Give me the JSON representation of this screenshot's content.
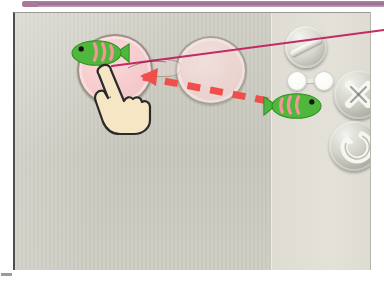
{
  "app": {
    "title": "Fish Transfer Simulation",
    "scene_type": "interactive-lab-panel"
  },
  "top_bar": {
    "name": "decorative-header-bar",
    "color": "#9a6d90"
  },
  "panel": {
    "background_color": "#c9c9bf",
    "right_strip_color": "#e0ded5",
    "border_color": "#4f4f4a"
  },
  "dishes": [
    {
      "id": "dish-left",
      "label": "Left petri dish",
      "fill_color": "#f6cccd",
      "contains_fish": true,
      "state": "active"
    },
    {
      "id": "dish-right",
      "label": "Right petri dish",
      "fill_color": "#f2d6d3",
      "contains_fish": false,
      "state": "faded",
      "ghost_text": ""
    }
  ],
  "fish": [
    {
      "id": "fish-in-dish",
      "label": "Green striped fish in left dish",
      "body_color": "#4fb83c",
      "stripe_color": "#f3969b",
      "eye_color": "#1a1a1a",
      "facing": "right",
      "position": "left-dish"
    },
    {
      "id": "fish-source",
      "label": "Green striped fish at source",
      "body_color": "#4fb83c",
      "stripe_color": "#f3969b",
      "eye_color": "#1a1a1a",
      "facing": "left",
      "position": "right-strip"
    }
  ],
  "annotations": {
    "dashed_arrow": {
      "name": "drag-path-arrow",
      "color": "#ef4f4a",
      "style": "dashed",
      "direction": "right-to-left",
      "meaning": "drag fish into left dish"
    },
    "guide_line": {
      "name": "magenta-guide-line",
      "color": "#c42a66",
      "style": "solid"
    }
  },
  "cursor": {
    "name": "pointing-hand-cursor",
    "fill_color": "#f7e6c4",
    "outline_color": "#2b2b2b",
    "gesture": "point"
  },
  "controls": [
    {
      "id": "knob",
      "label": "Adjustment screw knob",
      "icon": "screw-slot-icon",
      "interactable": true
    },
    {
      "id": "goggles",
      "label": "Safety goggles",
      "icon": "goggles-icon",
      "interactable": true
    },
    {
      "id": "btn-close",
      "label": "Close",
      "icon": "close-x-icon",
      "interactable": true
    },
    {
      "id": "btn-undo",
      "label": "Reset",
      "icon": "rotate-undo-icon",
      "interactable": true
    }
  ],
  "bottom_tick": {
    "name": "corner-tick-mark",
    "color": "#9b9b93"
  }
}
